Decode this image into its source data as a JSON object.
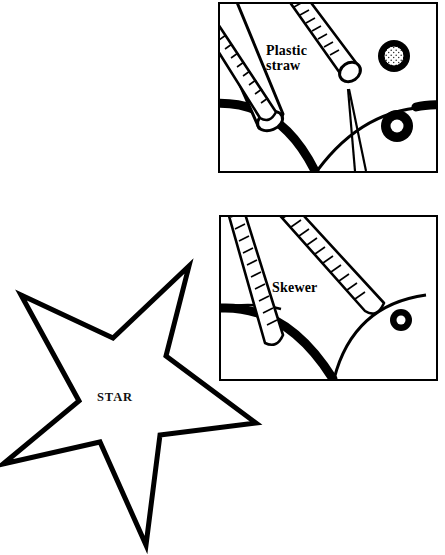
{
  "figure": {
    "background_color": "#ffffff",
    "ink_color": "#000000"
  },
  "panels": [
    {
      "id": "plastic-straw",
      "caption": "Plastic\nstraw",
      "bounds": {
        "x": 218,
        "y": 2,
        "width": 220,
        "height": 171
      },
      "contents": {
        "tool_label": "plastic straw",
        "objects": [
          "smooth-tube-straw",
          "ribbed-skewer-upper-left",
          "ribbed-skewer-upper-right",
          "balloon-arc-left",
          "balloon-arc-right",
          "stippled-ring",
          "solid-ring"
        ]
      }
    },
    {
      "id": "skewer",
      "caption": "Skewer",
      "bounds": {
        "x": 219,
        "y": 215,
        "width": 219,
        "height": 166
      },
      "contents": {
        "tool_label": "skewer",
        "objects": [
          "ribbed-skewer-left",
          "ribbed-skewer-right",
          "balloon-arc-left",
          "balloon-arc-right",
          "solid-ring"
        ]
      }
    }
  ],
  "star": {
    "label": "STAR",
    "points": 5,
    "style": "outline",
    "stroke_color": "#000000",
    "fill_color": "#ffffff",
    "stroke_width": 5,
    "vertices": [
      [
        189,
        11
      ],
      [
        166,
        101
      ],
      [
        256,
        168
      ],
      [
        160,
        180
      ],
      [
        146,
        290
      ],
      [
        100,
        187
      ],
      [
        3,
        209
      ],
      [
        79,
        146
      ],
      [
        21,
        40
      ],
      [
        113,
        83
      ]
    ],
    "label_position": {
      "x": 97,
      "y": 390
    }
  }
}
